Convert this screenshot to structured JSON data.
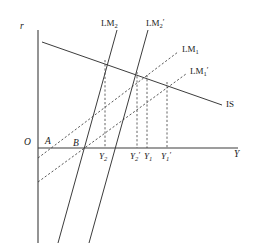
{
  "figure": {
    "type": "economics-diagram",
    "model": "IS-LM",
    "background_color": "#ffffff",
    "line_color": "#3c3c3c",
    "axis_color": "#3c3c3c"
  },
  "axes": {
    "y_axis_label": "r",
    "x_axis_label": "Y",
    "origin_label": "O",
    "origin_px": {
      "x": 38,
      "y": 148
    },
    "x_axis_end_px": {
      "x": 238,
      "y": 148
    },
    "y_axis_top_px": {
      "x": 38,
      "y": 30
    },
    "y_axis_bottom_px": {
      "x": 38,
      "y": 243
    }
  },
  "curves": [
    {
      "id": "IS",
      "label": "IS",
      "style": "solid",
      "label_px": {
        "x": 226,
        "y": 100
      },
      "from_px": {
        "x": 42,
        "y": 42
      },
      "to_px": {
        "x": 222,
        "y": 105
      }
    },
    {
      "id": "LM2",
      "label": "LM",
      "sub": "2",
      "prime": "",
      "style": "solid",
      "label_px": {
        "x": 101,
        "y": 19
      },
      "from_px": {
        "x": 58,
        "y": 243
      },
      "to_px": {
        "x": 117,
        "y": 30
      }
    },
    {
      "id": "LM2p",
      "label": "LM",
      "sub": "2",
      "prime": "′",
      "style": "solid",
      "label_px": {
        "x": 146,
        "y": 19
      },
      "from_px": {
        "x": 89,
        "y": 243
      },
      "to_px": {
        "x": 148,
        "y": 30
      }
    },
    {
      "id": "LM1",
      "label": "LM",
      "sub": "1",
      "prime": "",
      "style": "dashed",
      "label_px": {
        "x": 182,
        "y": 45
      },
      "from_px": {
        "x": 38,
        "y": 158
      },
      "to_px": {
        "x": 178,
        "y": 52
      }
    },
    {
      "id": "LM1p",
      "label": "LM",
      "sub": "1",
      "prime": "′",
      "style": "dashed",
      "label_px": {
        "x": 190,
        "y": 67
      },
      "from_px": {
        "x": 38,
        "y": 182
      },
      "to_px": {
        "x": 186,
        "y": 74
      }
    }
  ],
  "points": [
    {
      "id": "A",
      "label": "A",
      "label_px": {
        "x": 45,
        "y": 137
      },
      "at_px": {
        "x": 51,
        "y": 148
      }
    },
    {
      "id": "B",
      "label": "B",
      "label_px": {
        "x": 73,
        "y": 139
      },
      "at_px": {
        "x": 80,
        "y": 148
      }
    }
  ],
  "x_ticks": [
    {
      "id": "Y2",
      "label": "Y",
      "sub": "2",
      "prime": "",
      "x_px": 105,
      "label_px": {
        "x": 99,
        "y": 152
      },
      "drop_from_y_px": 60
    },
    {
      "id": "Y2p",
      "label": "Y",
      "sub": "2",
      "prime": "′",
      "x_px": 137,
      "label_px": {
        "x": 130,
        "y": 152
      },
      "drop_from_y_px": 72
    },
    {
      "id": "Y1",
      "label": "Y",
      "sub": "1",
      "prime": "",
      "x_px": 147,
      "label_px": {
        "x": 144,
        "y": 152
      },
      "drop_from_y_px": 75
    },
    {
      "id": "Y1p",
      "label": "Y",
      "sub": "1",
      "prime": "′",
      "x_px": 167,
      "label_px": {
        "x": 161,
        "y": 152
      },
      "drop_from_y_px": 82
    }
  ],
  "chart_data": {
    "type": "line",
    "title": "",
    "xlabel": "Y",
    "ylabel": "r",
    "grid": false,
    "legend": "inline-curve-labels",
    "series": [
      {
        "name": "IS",
        "style": "solid",
        "slope": "negative",
        "points": [
          [
            42,
            42
          ],
          [
            222,
            105
          ]
        ]
      },
      {
        "name": "LM2",
        "style": "solid",
        "slope": "steep-positive",
        "points": [
          [
            58,
            243
          ],
          [
            117,
            30
          ]
        ]
      },
      {
        "name": "LM2'",
        "style": "solid",
        "slope": "steep-positive",
        "points": [
          [
            89,
            243
          ],
          [
            148,
            30
          ]
        ]
      },
      {
        "name": "LM1",
        "style": "dashed",
        "slope": "shallow-positive",
        "points": [
          [
            38,
            158
          ],
          [
            178,
            52
          ]
        ]
      },
      {
        "name": "LM1'",
        "style": "dashed",
        "slope": "shallow-positive",
        "points": [
          [
            38,
            182
          ],
          [
            186,
            74
          ]
        ]
      }
    ],
    "equilibria": [
      {
        "name": "Y2",
        "curves": [
          "IS",
          "LM2"
        ],
        "x_px": 105,
        "y_px": 60
      },
      {
        "name": "Y2'",
        "curves": [
          "IS",
          "LM2'"
        ],
        "x_px": 137,
        "y_px": 72
      },
      {
        "name": "Y1",
        "curves": [
          "IS",
          "LM1"
        ],
        "x_px": 147,
        "y_px": 75
      },
      {
        "name": "Y1'",
        "curves": [
          "IS",
          "LM1'"
        ],
        "x_px": 167,
        "y_px": 82
      }
    ],
    "axis_intercept_points": [
      {
        "name": "A",
        "x_px": 51,
        "y_px": 148
      },
      {
        "name": "B",
        "x_px": 80,
        "y_px": 148
      }
    ]
  }
}
